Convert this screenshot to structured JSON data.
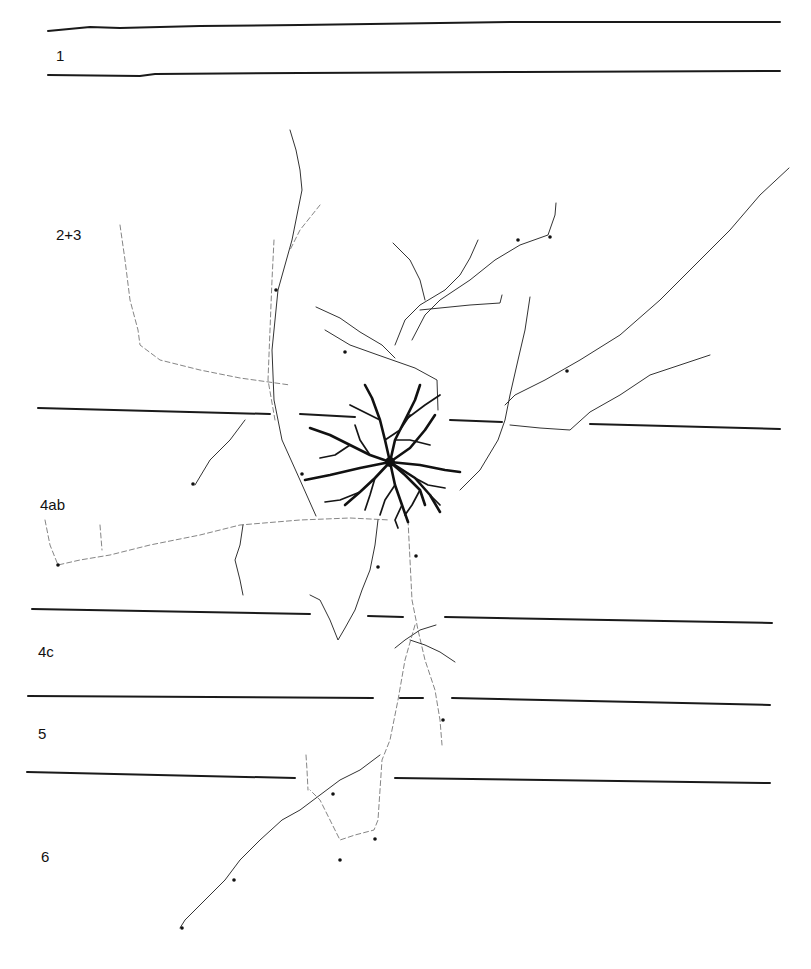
{
  "figure": {
    "type": "neuron-reconstruction-with-cortical-layers",
    "layers": [
      {
        "label": "1"
      },
      {
        "label": "2+3"
      },
      {
        "label": "4ab"
      },
      {
        "label": "4c"
      },
      {
        "label": "5"
      },
      {
        "label": "6"
      }
    ],
    "colors": {
      "background": "#ffffff",
      "ink": "#111111"
    }
  }
}
